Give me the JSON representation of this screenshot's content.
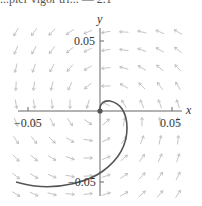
{
  "header_fragment": "...pler vigor tri... — 2.1",
  "chart_data": {
    "type": "line",
    "title": "",
    "xlabel": "x",
    "ylabel": "y",
    "xlim": [
      -0.07,
      0.057
    ],
    "ylim": [
      -0.06,
      0.063
    ],
    "xticks": [
      -0.05,
      0.05
    ],
    "yticks": [
      -0.05,
      0.05
    ],
    "xtick_labels": [
      "−0.05",
      "0.05"
    ],
    "ytick_labels": [
      "−0.05",
      "0.05"
    ],
    "grid": false,
    "legend": null,
    "series": [
      {
        "name": "trajectory",
        "color": "#555555",
        "x": [
          0.0,
          0.0005,
          0.003,
          0.008,
          0.014,
          0.018,
          0.019,
          0.018,
          0.014,
          0.008,
          0.0,
          -0.012,
          -0.025,
          -0.04,
          -0.058
        ],
        "y": [
          0.0,
          0.004,
          0.0065,
          0.0055,
          0.0,
          -0.008,
          -0.015,
          -0.025,
          -0.035,
          -0.044,
          -0.0435,
          -0.052,
          -0.054,
          -0.054,
          -0.051
        ]
      }
    ],
    "vector_field": {
      "color": "#bdbdbd",
      "pattern": "counter-clockwise rotation about origin with outward spiral",
      "grid_spacing_px": 18
    },
    "origin_marker": {
      "x": 0,
      "y": 0,
      "color": "#555555"
    }
  },
  "labels": {
    "x_axis": "x",
    "y_axis": "y",
    "x_neg": "−0.05",
    "x_pos": "0.05",
    "y_pos": "0.05",
    "y_neg": "−0.05"
  }
}
